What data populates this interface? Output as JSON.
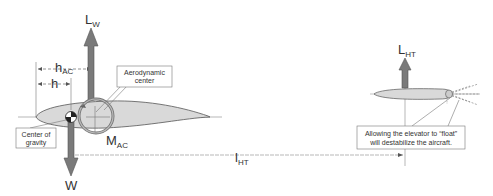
{
  "labels": {
    "wing_lift": "L",
    "wing_lift_sub": "W",
    "tail_lift": "L",
    "tail_lift_sub": "HT",
    "weight": "W",
    "h_ac": "h",
    "h_ac_sub": "AC",
    "h": "h",
    "moment": "M",
    "moment_sub": "AC",
    "tail_arm": "l",
    "tail_arm_sub": "HT"
  },
  "callouts": {
    "aero_center_line1": "Aerodynamic",
    "aero_center_line2": "center",
    "cg_line1": "Center of",
    "cg_line2": "gravity",
    "elevator_line1": "Allowing the elevator to “float”",
    "elevator_line2": "will destabilize the aircraft."
  },
  "colors": {
    "arrow": "#7a7a7a",
    "airfoil_fill": "#d9d9d9",
    "airfoil_stroke": "#555555",
    "line": "#888888",
    "text": "#333333"
  }
}
